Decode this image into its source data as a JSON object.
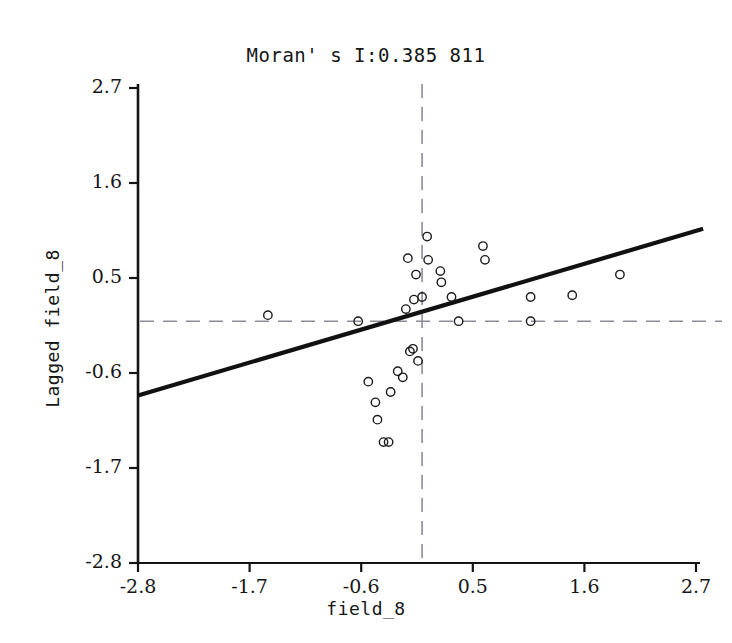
{
  "chart_data": {
    "type": "scatter",
    "title": "Moran' s I:0.385 811",
    "moran_i": "0.385 811",
    "xlabel": "field_8",
    "ylabel": "Lagged field_8",
    "xlim": [
      -2.8,
      2.7
    ],
    "ylim": [
      -2.8,
      2.7
    ],
    "xticks": [
      "-2.8",
      "-1.7",
      "-0.6",
      "0.5",
      "1.6",
      "2.7"
    ],
    "xtick_values": [
      -2.8,
      -1.7,
      -0.6,
      0.5,
      1.6,
      2.7
    ],
    "yticks": [
      "2.7",
      "1.6",
      "0.5",
      "-0.6",
      "-1.7",
      "-2.8"
    ],
    "ytick_values": [
      2.7,
      1.6,
      0.5,
      -0.6,
      -1.7,
      -2.8
    ],
    "grid": false,
    "legend": null,
    "reference_lines": {
      "horizontal": {
        "y": 0.0,
        "style": "dashed",
        "color": "#8c8c99"
      },
      "vertical": {
        "x": 0.0,
        "style": "dashed",
        "color": "#8c8c99"
      }
    },
    "fit_line": {
      "style": "solid",
      "color": "#111111",
      "slope": 0.3858,
      "intercept": 0.0,
      "x_start": -2.8,
      "y_start": -0.86,
      "x_end": 2.77,
      "y_end": 1.07
    },
    "marker_style": {
      "shape": "open-circle",
      "radius_px": 4.2,
      "color": "#1c1c1c"
    },
    "points": [
      {
        "x": -1.52,
        "y": 0.07
      },
      {
        "x": -0.63,
        "y": 0.0
      },
      {
        "x": -0.53,
        "y": -0.7
      },
      {
        "x": -0.46,
        "y": -0.94
      },
      {
        "x": -0.44,
        "y": -1.14
      },
      {
        "x": -0.38,
        "y": -1.4
      },
      {
        "x": -0.33,
        "y": -1.4
      },
      {
        "x": -0.31,
        "y": -0.82
      },
      {
        "x": -0.24,
        "y": -0.58
      },
      {
        "x": -0.19,
        "y": -0.65
      },
      {
        "x": -0.16,
        "y": 0.14
      },
      {
        "x": -0.14,
        "y": 0.73
      },
      {
        "x": -0.12,
        "y": -0.35
      },
      {
        "x": -0.09,
        "y": -0.32
      },
      {
        "x": -0.08,
        "y": 0.25
      },
      {
        "x": -0.06,
        "y": 0.54
      },
      {
        "x": -0.04,
        "y": -0.46
      },
      {
        "x": 0.0,
        "y": 0.28
      },
      {
        "x": 0.05,
        "y": 0.98
      },
      {
        "x": 0.06,
        "y": 0.71
      },
      {
        "x": 0.18,
        "y": 0.58
      },
      {
        "x": 0.19,
        "y": 0.45
      },
      {
        "x": 0.29,
        "y": 0.28
      },
      {
        "x": 0.36,
        "y": 0.0
      },
      {
        "x": 0.6,
        "y": 0.87
      },
      {
        "x": 0.62,
        "y": 0.71
      },
      {
        "x": 1.07,
        "y": 0.28
      },
      {
        "x": 1.07,
        "y": 0.0
      },
      {
        "x": 1.48,
        "y": 0.3
      },
      {
        "x": 1.95,
        "y": 0.54
      }
    ]
  }
}
